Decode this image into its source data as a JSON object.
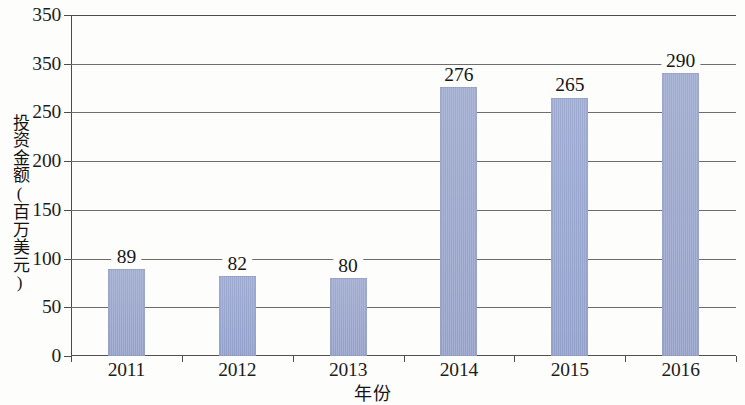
{
  "chart_data": {
    "type": "bar",
    "title": "",
    "subtitle": "",
    "xlabel": "年份",
    "ylabel": "投资金额(百万美元)",
    "categories": [
      "2011",
      "2012",
      "2013",
      "2014",
      "2015",
      "2016"
    ],
    "values": [
      89,
      82,
      80,
      276,
      265,
      290
    ],
    "value_labels": [
      "89",
      "82",
      "80",
      "276",
      "265",
      "290"
    ],
    "series": [
      {
        "name": "投资金额",
        "values": [
          89,
          82,
          80,
          276,
          265,
          290
        ]
      }
    ],
    "ylim": [
      0,
      350
    ],
    "yticks": [
      0,
      50,
      100,
      150,
      200,
      250,
      300,
      350
    ],
    "ytick_labels": [
      "0",
      "50",
      "100",
      "150",
      "200",
      "250",
      "350",
      "350"
    ],
    "xtick_labels": [
      "2011",
      "2012",
      "2013",
      "2014",
      "2015",
      "2016"
    ],
    "grid": true,
    "grid_axis": "y",
    "legend": false,
    "legend_position": "none",
    "bar_color": "#98a5cd",
    "axis_color": "#4c4c4c",
    "grid_color": "#6e6d6b",
    "text_color": "#1c1c1c",
    "background_color": "#fdfdfb",
    "annotations": []
  }
}
